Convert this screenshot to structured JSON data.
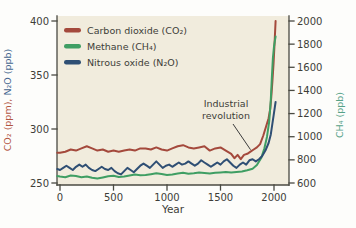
{
  "figure": {
    "background": "#fdfdfb",
    "plot_background": "#f1ecdd",
    "axis_color": "#4a4a42",
    "text_color": "#3d3d38"
  },
  "chart_data": {
    "type": "line",
    "title": "",
    "xlabel": "Year",
    "x_ticks": [
      0,
      500,
      1000,
      1500,
      2000
    ],
    "x_range": [
      -28,
      2140
    ],
    "grid": false,
    "legend_position": "top-left",
    "left_axis": {
      "label": "CO₂ (ppm), N₂O (ppb)",
      "label_parts": [
        {
          "text": "CO₂ (ppm),",
          "color": "#b2553f"
        },
        {
          "text": " N₂O (ppb)",
          "color": "#44658e"
        }
      ],
      "ticks": [
        250,
        300,
        350,
        400
      ],
      "range": [
        250,
        400
      ]
    },
    "right_axis": {
      "label": "CH₄ (ppb)",
      "color": "#55a287",
      "ticks": [
        600,
        800,
        1000,
        1200,
        1400,
        1600,
        1800,
        2000
      ],
      "range": [
        600,
        2000
      ]
    },
    "annotation": {
      "lines": [
        "Industrial",
        "revolution"
      ],
      "target_year": 1790,
      "target_series": "Carbon dioxide (CO₂)"
    },
    "series": [
      {
        "name": "Carbon dioxide (CO₂)",
        "axis": "left",
        "unit": "ppm",
        "color": "#a4493c",
        "points": [
          [
            -25,
            278
          ],
          [
            0,
            278
          ],
          [
            50,
            279
          ],
          [
            100,
            281
          ],
          [
            150,
            280
          ],
          [
            200,
            282
          ],
          [
            250,
            284
          ],
          [
            300,
            282
          ],
          [
            350,
            280
          ],
          [
            400,
            281
          ],
          [
            450,
            279
          ],
          [
            500,
            280
          ],
          [
            550,
            279
          ],
          [
            600,
            280
          ],
          [
            650,
            281
          ],
          [
            700,
            280
          ],
          [
            750,
            282
          ],
          [
            800,
            282
          ],
          [
            850,
            281
          ],
          [
            900,
            283
          ],
          [
            950,
            281
          ],
          [
            1000,
            280
          ],
          [
            1050,
            282
          ],
          [
            1100,
            284
          ],
          [
            1150,
            285
          ],
          [
            1200,
            283
          ],
          [
            1250,
            282
          ],
          [
            1300,
            283
          ],
          [
            1350,
            284
          ],
          [
            1400,
            280
          ],
          [
            1450,
            282
          ],
          [
            1500,
            283
          ],
          [
            1550,
            280
          ],
          [
            1600,
            277
          ],
          [
            1630,
            273
          ],
          [
            1660,
            276
          ],
          [
            1690,
            272
          ],
          [
            1720,
            276
          ],
          [
            1750,
            277
          ],
          [
            1780,
            279
          ],
          [
            1810,
            281
          ],
          [
            1840,
            283
          ],
          [
            1870,
            286
          ],
          [
            1900,
            294
          ],
          [
            1925,
            302
          ],
          [
            1950,
            310
          ],
          [
            1965,
            319
          ],
          [
            1975,
            330
          ],
          [
            1985,
            344
          ],
          [
            1995,
            360
          ],
          [
            2005,
            378
          ],
          [
            2015,
            400
          ]
        ]
      },
      {
        "name": "Methane (CH₄)",
        "axis": "right",
        "unit": "ppb",
        "color": "#3f9e63",
        "points": [
          [
            -25,
            660
          ],
          [
            0,
            655
          ],
          [
            50,
            650
          ],
          [
            100,
            665
          ],
          [
            150,
            660
          ],
          [
            200,
            650
          ],
          [
            250,
            655
          ],
          [
            300,
            645
          ],
          [
            350,
            638
          ],
          [
            400,
            648
          ],
          [
            450,
            658
          ],
          [
            500,
            663
          ],
          [
            550,
            652
          ],
          [
            600,
            656
          ],
          [
            650,
            666
          ],
          [
            700,
            673
          ],
          [
            750,
            667
          ],
          [
            800,
            669
          ],
          [
            850,
            676
          ],
          [
            900,
            684
          ],
          [
            950,
            677
          ],
          [
            1000,
            668
          ],
          [
            1050,
            673
          ],
          [
            1100,
            681
          ],
          [
            1150,
            688
          ],
          [
            1200,
            680
          ],
          [
            1250,
            684
          ],
          [
            1300,
            690
          ],
          [
            1350,
            686
          ],
          [
            1400,
            682
          ],
          [
            1450,
            688
          ],
          [
            1500,
            692
          ],
          [
            1550,
            696
          ],
          [
            1600,
            691
          ],
          [
            1650,
            695
          ],
          [
            1700,
            700
          ],
          [
            1750,
            710
          ],
          [
            1800,
            724
          ],
          [
            1840,
            755
          ],
          [
            1880,
            815
          ],
          [
            1910,
            900
          ],
          [
            1935,
            1000
          ],
          [
            1955,
            1130
          ],
          [
            1970,
            1320
          ],
          [
            1980,
            1520
          ],
          [
            1990,
            1680
          ],
          [
            2000,
            1780
          ],
          [
            2008,
            1830
          ],
          [
            2015,
            1865
          ]
        ]
      },
      {
        "name": "Nitrous oxide (N₂O)",
        "axis": "left",
        "unit": "ppb",
        "color": "#2f4f74",
        "points": [
          [
            -25,
            263
          ],
          [
            0,
            262
          ],
          [
            30,
            264
          ],
          [
            60,
            266
          ],
          [
            90,
            264
          ],
          [
            120,
            262
          ],
          [
            150,
            265
          ],
          [
            180,
            267
          ],
          [
            210,
            265
          ],
          [
            240,
            267
          ],
          [
            270,
            264
          ],
          [
            300,
            262
          ],
          [
            330,
            261
          ],
          [
            360,
            263
          ],
          [
            390,
            265
          ],
          [
            420,
            263
          ],
          [
            450,
            262
          ],
          [
            480,
            264
          ],
          [
            510,
            261
          ],
          [
            540,
            259
          ],
          [
            570,
            258
          ],
          [
            600,
            261
          ],
          [
            630,
            264
          ],
          [
            660,
            262
          ],
          [
            690,
            260
          ],
          [
            720,
            263
          ],
          [
            750,
            266
          ],
          [
            780,
            268
          ],
          [
            810,
            266
          ],
          [
            840,
            264
          ],
          [
            870,
            267
          ],
          [
            900,
            270
          ],
          [
            930,
            267
          ],
          [
            960,
            264
          ],
          [
            990,
            266
          ],
          [
            1020,
            267
          ],
          [
            1050,
            265
          ],
          [
            1080,
            267
          ],
          [
            1110,
            269
          ],
          [
            1140,
            267
          ],
          [
            1170,
            268
          ],
          [
            1200,
            270
          ],
          [
            1230,
            268
          ],
          [
            1260,
            266
          ],
          [
            1290,
            268
          ],
          [
            1320,
            271
          ],
          [
            1350,
            269
          ],
          [
            1380,
            267
          ],
          [
            1410,
            265
          ],
          [
            1440,
            267
          ],
          [
            1470,
            269
          ],
          [
            1500,
            267
          ],
          [
            1530,
            270
          ],
          [
            1560,
            272
          ],
          [
            1590,
            269
          ],
          [
            1620,
            266
          ],
          [
            1650,
            264
          ],
          [
            1680,
            267
          ],
          [
            1710,
            269
          ],
          [
            1740,
            267
          ],
          [
            1770,
            271
          ],
          [
            1800,
            272
          ],
          [
            1830,
            270
          ],
          [
            1860,
            272
          ],
          [
            1890,
            275
          ],
          [
            1920,
            280
          ],
          [
            1950,
            287
          ],
          [
            1970,
            295
          ],
          [
            1985,
            305
          ],
          [
            2000,
            315
          ],
          [
            2015,
            325
          ]
        ]
      }
    ]
  }
}
